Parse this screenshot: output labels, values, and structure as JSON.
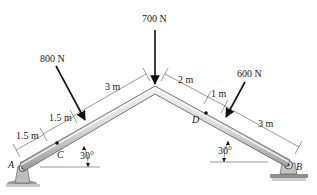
{
  "diagram": {
    "type": "bent beam / frame with pin supports",
    "members": [
      {
        "name": "left member",
        "from": "A",
        "to": "apex",
        "angle_label": "30°"
      },
      {
        "name": "right member",
        "from": "apex",
        "to": "B",
        "angle_label": "30°"
      }
    ],
    "supports": [
      {
        "label": "A",
        "type": "pin"
      },
      {
        "label": "B",
        "type": "pin"
      }
    ],
    "points": [
      {
        "label": "C"
      },
      {
        "label": "D"
      }
    ],
    "loads": [
      {
        "label": "800 N",
        "location": "left member"
      },
      {
        "label": "700 N",
        "location": "apex"
      },
      {
        "label": "600 N",
        "location": "right member"
      }
    ],
    "dimensions": {
      "left": [
        "1.5 m",
        "1.5 m",
        "3 m"
      ],
      "right": [
        "2 m",
        "1 m",
        "3 m"
      ]
    },
    "angles": {
      "left": "30°",
      "right": "30°"
    }
  },
  "colors": {
    "beam_light": "#e6e6e6",
    "beam_dark": "#8a8a8a",
    "ink": "#111111",
    "support": "#b5b5b5"
  }
}
